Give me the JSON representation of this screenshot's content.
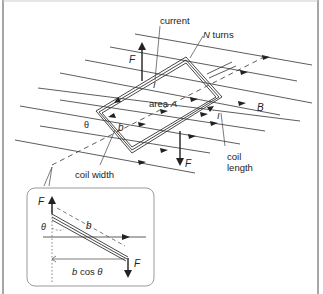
{
  "diagram": {
    "type": "physics-illustration",
    "labels": {
      "current": "current",
      "n_turns": "N turns",
      "force_top": "F",
      "force_bottom": "F",
      "area": "area A",
      "current_symbol_1": "I",
      "current_symbol_2": "I",
      "field": "B",
      "theta": "θ",
      "width_symbol": "b",
      "coil_width": "coil width",
      "coil_length_1": "coil",
      "coil_length_2": "length"
    },
    "inset": {
      "force_top": "F",
      "force_bottom": "F",
      "theta": "θ",
      "width_symbol": "b",
      "projection": "b cos θ"
    },
    "colors": {
      "line": "#222222",
      "frame": "#888888",
      "inset_border": "#999999",
      "background": "#ffffff"
    }
  }
}
